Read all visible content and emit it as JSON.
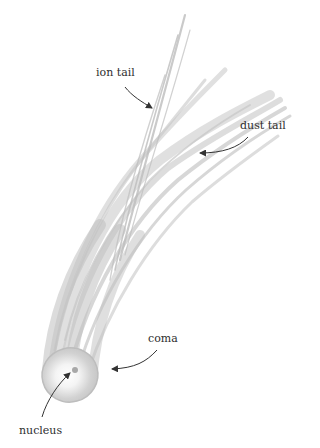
{
  "diagram": {
    "labels": {
      "ion_tail": "ion tail",
      "dust_tail": "dust tail",
      "coma": "coma",
      "nucleus": "nucleus"
    },
    "colors": {
      "background": "#ffffff",
      "comet_gray": "#c4c4c4",
      "label_text": "#2e2e2e",
      "arrow": "#333333"
    }
  }
}
